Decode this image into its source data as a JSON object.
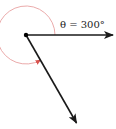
{
  "diagram": {
    "angle_label": "θ = 300°",
    "angle_degrees": 300,
    "vertex": {
      "x": 26,
      "y": 35
    },
    "initial_side": {
      "direction": "positive x-axis",
      "end": {
        "x": 114,
        "y": 35
      }
    },
    "terminal_side": {
      "direction_degrees": 300,
      "end": {
        "x": 77,
        "y": 124
      }
    },
    "arc": {
      "radius": 29,
      "orientation": "counterclockwise",
      "from_degrees": 0,
      "to_degrees": 300
    },
    "colors": {
      "rays": "#1a1a1a",
      "arc": "#e07a7a",
      "vertex": "#000000",
      "background": "#ffffff"
    }
  }
}
